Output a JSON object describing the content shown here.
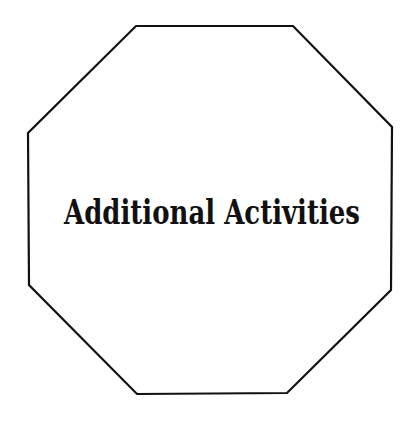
{
  "canvas": {
    "width": 414,
    "height": 425,
    "background": "#ffffff"
  },
  "octagon": {
    "stroke": "#111111",
    "stroke_width": 2.2,
    "fill": "#ffffff",
    "points": "136,26 293,26 392,127 391,290 287,393 137,394 29,285 28,133"
  },
  "title": {
    "text": "Additional Activities",
    "color": "#111111",
    "x": 212,
    "y": 224,
    "font_size": 34
  }
}
